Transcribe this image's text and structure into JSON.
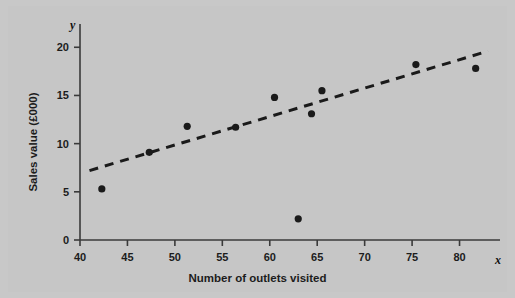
{
  "chart_data": {
    "type": "scatter",
    "title": "",
    "xlabel": "Number of outlets visited",
    "ylabel": "Sales value (£000)",
    "x_axis_variable": "x",
    "y_axis_variable": "y",
    "xlim": [
      40,
      83
    ],
    "ylim": [
      0,
      22
    ],
    "xticks": [
      40,
      45,
      50,
      55,
      60,
      65,
      70,
      75,
      80
    ],
    "yticks": [
      0,
      5,
      10,
      15,
      20
    ],
    "xtick_labels": [
      "40",
      "45",
      "50",
      "55",
      "60",
      "65",
      "70",
      "75",
      "80"
    ],
    "ytick_labels": [
      "0",
      "5",
      "10",
      "15",
      "20"
    ],
    "grid": false,
    "legend": "none",
    "points": [
      {
        "x": 42.3,
        "y": 5.3
      },
      {
        "x": 47.3,
        "y": 9.1
      },
      {
        "x": 51.3,
        "y": 11.8
      },
      {
        "x": 56.4,
        "y": 11.7
      },
      {
        "x": 60.5,
        "y": 14.8
      },
      {
        "x": 63.0,
        "y": 2.2
      },
      {
        "x": 64.4,
        "y": 13.1
      },
      {
        "x": 65.5,
        "y": 15.5
      },
      {
        "x": 75.4,
        "y": 18.2
      },
      {
        "x": 81.7,
        "y": 17.8
      }
    ],
    "trend_line": {
      "style": "dashed",
      "x_start": 41.0,
      "y_start": 7.2,
      "x_end": 83.0,
      "y_end": 19.6
    },
    "marker_color": "#1a1a1a",
    "line_color": "#1a1a1a",
    "background_color": "#c6c6c6",
    "axis_color": "#3a3a3a"
  }
}
